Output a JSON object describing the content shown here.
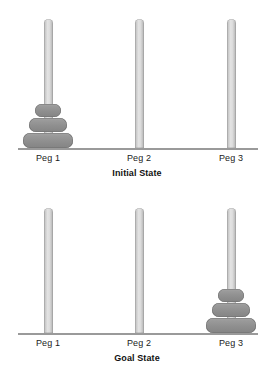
{
  "diagram": {
    "background_color": "#ffffff",
    "peg_color": "#d8d8d8",
    "disk_color": "#8f8f8f",
    "baseline_color": "#9a9a9a",
    "text_color": "#1b1b1b"
  },
  "panels": [
    {
      "id": "initial",
      "state_label": "Initial State",
      "pegs": [
        {
          "label": "Peg 1",
          "center_x": 48,
          "disks": [
            1,
            2,
            3
          ]
        },
        {
          "label": "Peg 2",
          "center_x": 139,
          "disks": []
        },
        {
          "label": "Peg 3",
          "center_x": 231,
          "disks": []
        }
      ]
    },
    {
      "id": "goal",
      "state_label": "Goal State",
      "pegs": [
        {
          "label": "Peg 1",
          "center_x": 48,
          "disks": []
        },
        {
          "label": "Peg 2",
          "center_x": 139,
          "disks": []
        },
        {
          "label": "Peg 3",
          "center_x": 231,
          "disks": [
            1,
            2,
            3
          ]
        }
      ]
    }
  ],
  "disk_sizes": [
    {
      "size": 1,
      "name": "small-disk",
      "width": 26,
      "height": 13
    },
    {
      "size": 2,
      "name": "medium-disk",
      "width": 38,
      "height": 14
    },
    {
      "size": 3,
      "name": "large-disk",
      "width": 50,
      "height": 15
    }
  ]
}
